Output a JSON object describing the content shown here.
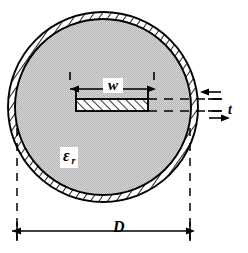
{
  "figure": {
    "type": "engineering-cross-section-diagram",
    "canvas": {
      "width": 248,
      "height": 253,
      "background": "#ffffff"
    }
  },
  "labels": {
    "width_symbol": "w",
    "thickness_symbol": "t",
    "diameter_symbol": "D",
    "permittivity_symbol": "ε",
    "permittivity_subscript": "r"
  },
  "geometry": {
    "outer_circle": {
      "cx": 103,
      "cy": 107,
      "r_outer": 95,
      "r_inner": 88
    },
    "strip": {
      "x": 76,
      "y": 99,
      "width": 72,
      "height": 12
    },
    "strip_top_guide_y": 90,
    "dimension_w": {
      "x1": 78,
      "x2": 147,
      "y": 89
    },
    "dimension_t": {
      "x": 215,
      "y1": 88,
      "y2": 124
    },
    "dimension_D": {
      "x1": 17,
      "x2": 190,
      "y": 230
    },
    "extension_lines": {
      "left_x": 17,
      "right_x": 190,
      "y_top": 128,
      "y_bottom": 243
    }
  },
  "colors": {
    "dielectric_fill": "#c9c9c9",
    "stroke": "#000000",
    "wall_fill": "#ffffff",
    "conductor_fill": "#ffffff",
    "background": "#ffffff"
  },
  "elements": {
    "outer_wall_name": "Conducting shield wall (hatched annulus)",
    "dielectric_name": "Dielectric filling",
    "strip_name": "Center strip conductor (hatched)",
    "dashed_guides": "Horizontal dashed reference lines for t"
  }
}
